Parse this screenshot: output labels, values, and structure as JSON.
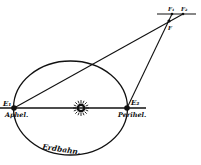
{
  "diagram": {
    "colors": {
      "ink": "#111111",
      "background": "#ffffff"
    },
    "labels": {
      "earth_aphelion": "E₁",
      "earth_perihelion": "E₂",
      "aphelion": "Aphel.",
      "perihelion": "Perihel.",
      "orbit": "Erdbahn.",
      "star": "F",
      "star_pos1": "F₁",
      "star_pos2": "F₂"
    },
    "icons": {
      "sun": "sun-icon"
    }
  }
}
